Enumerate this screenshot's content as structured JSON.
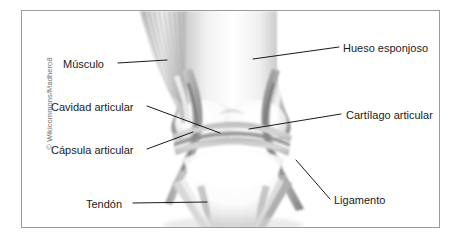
{
  "figure": {
    "kind": "anatomical-diagram",
    "credit": "© Wikicommons/Madhero8",
    "frame_color": "#9b9b9b",
    "background_color": "#ffffff",
    "leader_line_color": "#1b1b1b",
    "label_text_color": "#1b1b1b"
  },
  "labels": [
    {
      "id": "musculo",
      "text": "Músculo",
      "side": "left",
      "x": 62,
      "y": 57
    },
    {
      "id": "cavidad-articular",
      "text": "Cavidad articular",
      "side": "left",
      "x": 50,
      "y": 100
    },
    {
      "id": "capsula-articular",
      "text": "Cápsula articular",
      "side": "left",
      "x": 50,
      "y": 143
    },
    {
      "id": "tendon",
      "text": "Tendón",
      "side": "left",
      "x": 85,
      "y": 197
    },
    {
      "id": "hueso-esponjoso",
      "text": "Hueso esponjoso",
      "side": "right",
      "x": 342,
      "y": 41
    },
    {
      "id": "cartilago-articular",
      "text": "Cartílago articular",
      "side": "right",
      "x": 345,
      "y": 108
    },
    {
      "id": "ligamento",
      "text": "Ligamento",
      "side": "right",
      "x": 333,
      "y": 193
    }
  ],
  "anatomy_parts": [
    "femur",
    "tibia",
    "muscle-fibers",
    "joint-capsule",
    "articular-cartilage",
    "joint-cavity",
    "tendon",
    "ligament"
  ]
}
